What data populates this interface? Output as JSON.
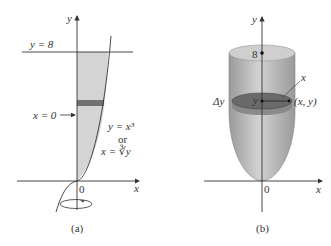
{
  "panel_a": {
    "caption": "(a)",
    "y_axis_label": "y",
    "x_axis_label": "x",
    "origin_label": "0",
    "line_label": "y = 8",
    "x0_label": "x = 0",
    "curve_label_1": "y = x³",
    "curve_label_or": "or",
    "curve_label_2": "x = ∛y",
    "colors": {
      "region": "#d4d4d4",
      "strip": "#707070",
      "axis": "#333333"
    }
  },
  "panel_b": {
    "caption": "(b)",
    "y_axis_label": "y",
    "x_axis_label": "x",
    "origin_label": "0",
    "top_label": "8",
    "radius_label": "x",
    "center_label": "y",
    "point_label": "(x, y)",
    "thickness_label": "Δy",
    "colors": {
      "solid": "#bdbdbd",
      "disk": "#6a6a6a",
      "axis": "#333333"
    }
  }
}
